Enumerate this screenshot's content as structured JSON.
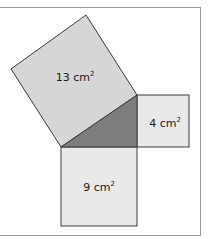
{
  "diagram": {
    "type": "pythagorean-squares",
    "colors": {
      "large_square": "#d6d6d6",
      "small_squares": "#e9e9e9",
      "triangle": "#7d7d7d",
      "stroke": "#3a3a3a",
      "frame": "#9a9a9a"
    },
    "squares": [
      {
        "id": "hypotenuse",
        "value": "13",
        "unit": "cm",
        "exponent": "2"
      },
      {
        "id": "right-leg",
        "value": "4",
        "unit": "cm",
        "exponent": "2"
      },
      {
        "id": "bottom-leg",
        "value": "9",
        "unit": "cm",
        "exponent": "2"
      }
    ]
  }
}
